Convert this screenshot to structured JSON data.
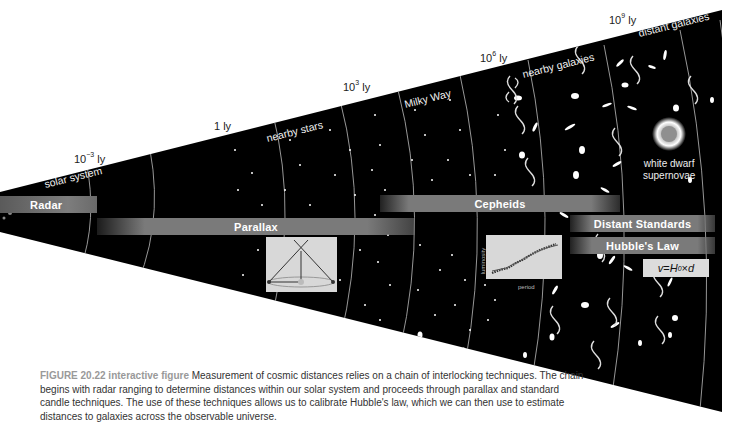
{
  "figure": {
    "distance_markers": [
      {
        "base": "10",
        "exp": "−3",
        "unit": "ly"
      },
      {
        "text": "1 ly"
      },
      {
        "base": "10",
        "exp": "3",
        "unit": "ly"
      },
      {
        "base": "10",
        "exp": "6",
        "unit": "ly"
      },
      {
        "base": "10",
        "exp": "9",
        "unit": "ly"
      }
    ],
    "regions": [
      "solar system",
      "nearby stars",
      "Milky Way",
      "nearby galaxies",
      "distant galaxies"
    ],
    "techniques": {
      "radar": "Radar",
      "parallax": "Parallax",
      "cepheids": "Cepheids",
      "distant_standards": "Distant Standards",
      "hubble": "Hubble's Law"
    },
    "formula": {
      "v": "v",
      "eq": " = ",
      "H": "H",
      "sub": "0",
      "times": " × ",
      "d": "d"
    },
    "supernova_label": [
      "white dwarf",
      "supernovae"
    ],
    "cepheid_plot": {
      "xlabel": "period",
      "ylabel": "luminosity"
    },
    "colors": {
      "space": "#000000",
      "bar": "#7a7a7a",
      "inset": "#d8d8d8",
      "caption_label": "#999999"
    }
  },
  "caption": {
    "label": "FIGURE 20.22 interactive figure",
    "text": " Measurement of cosmic distances relies on a chain of interlocking techniques. The chain begins with radar ranging to determine distances within our solar system and proceeds through parallax and standard candle techniques. The use of these techniques allows us to calibrate Hubble's law, which we can then use to estimate distances to galaxies across the observable universe."
  }
}
